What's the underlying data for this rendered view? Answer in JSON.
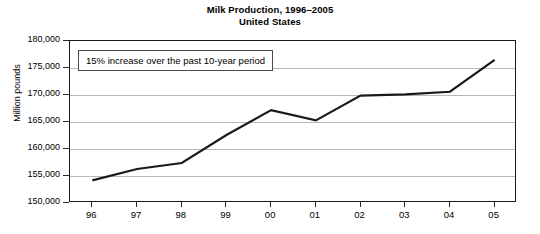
{
  "chart_data": {
    "type": "line",
    "title": "Milk Production, 1996–2005",
    "subtitle": "United States",
    "xlabel": "",
    "ylabel": "Million pounds",
    "categories": [
      "96",
      "97",
      "98",
      "99",
      "00",
      "01",
      "02",
      "03",
      "04",
      "05"
    ],
    "x_full": [
      "1996",
      "1997",
      "1998",
      "1999",
      "2000",
      "2001",
      "2002",
      "2003",
      "2004",
      "2005"
    ],
    "values": [
      154200,
      156300,
      157400,
      162600,
      167200,
      165300,
      169900,
      170100,
      170600,
      176500
    ],
    "series": [
      {
        "name": "Milk production",
        "values": [
          154200,
          156300,
          157400,
          162600,
          167200,
          165300,
          169900,
          170100,
          170600,
          176500
        ]
      }
    ],
    "ylim": [
      150000,
      180000
    ],
    "ytick_values": [
      150000,
      155000,
      160000,
      165000,
      170000,
      175000,
      180000
    ],
    "ytick_labels": [
      "150,000",
      "155,000",
      "160,000",
      "165,000",
      "170,000",
      "175,000",
      "180,000"
    ],
    "grid": true,
    "legend": "none",
    "line_color": "#1a1a1a",
    "grid_color": "#b8b8b8",
    "axis_color": "#1a1a1a",
    "annotations": [
      {
        "text": "15% increase over the past 10-year period",
        "x": 78,
        "y": 50
      }
    ]
  }
}
